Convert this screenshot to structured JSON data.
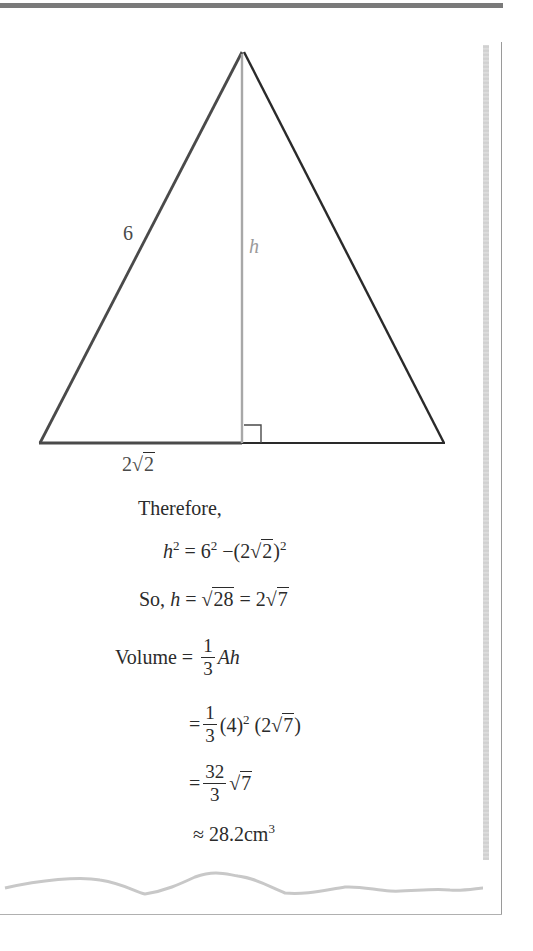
{
  "diagram": {
    "side_label": "6",
    "height_label": "h",
    "base_label_coef": "2",
    "base_label_radicand": "2",
    "right_angle_marker": true
  },
  "solution": {
    "intro": "Therefore,",
    "line1": {
      "lhs": "h",
      "lhs_exp": "2",
      "eq": "=",
      "a": "6",
      "a_exp": "2",
      "minus": "−",
      "paren_open": "(",
      "coef": "2",
      "radicand": "2",
      "paren_close": ")",
      "outer_exp": "2"
    },
    "line2": {
      "prefix": "So, ",
      "var": "h",
      "eq1": " = ",
      "radicand1": "28",
      "eq2": " = ",
      "coef": "2",
      "radicand2": "7"
    },
    "line3": {
      "word": "Volume",
      "eq": " = ",
      "num": "1",
      "den": "3",
      "rest": "Ah"
    },
    "line4": {
      "eq": "=",
      "num": "1",
      "den": "3",
      "base": "(4)",
      "exp": "2",
      "paren_open": "(",
      "coef": "2",
      "radicand": "7",
      "paren_close": ")"
    },
    "line5": {
      "eq": "=",
      "num": "32",
      "den": "3",
      "radicand": "7"
    },
    "line6": {
      "approx": "≈",
      "value": "28.2",
      "unit": "cm",
      "unit_exp": "3"
    }
  }
}
